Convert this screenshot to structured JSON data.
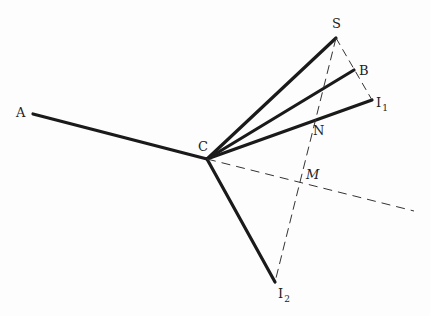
{
  "diagram": {
    "stroke_color": "#1a1a1a",
    "points": {
      "A": {
        "label": "A",
        "x": 33,
        "y": 114
      },
      "C": {
        "label": "C",
        "x": 207,
        "y": 159
      },
      "S": {
        "label": "S",
        "x": 336,
        "y": 38
      },
      "B": {
        "label": "B",
        "x": 354,
        "y": 70
      },
      "I1": {
        "label": "I",
        "sub": "1",
        "x": 372,
        "y": 100
      },
      "I2": {
        "label": "I",
        "sub": "2",
        "x": 275,
        "y": 282
      },
      "N": {
        "label": "N"
      },
      "M": {
        "label": "M"
      }
    },
    "solid_segments": [
      [
        "A",
        "C"
      ],
      [
        "C",
        "S"
      ],
      [
        "C",
        "B"
      ],
      [
        "C",
        "I1"
      ],
      [
        "C",
        "I2"
      ]
    ],
    "dashed_segments": [
      [
        "S",
        "I1"
      ],
      [
        "S",
        "I2"
      ],
      [
        "C",
        "end"
      ]
    ],
    "dashed_end": {
      "x": 414,
      "y": 211
    }
  }
}
